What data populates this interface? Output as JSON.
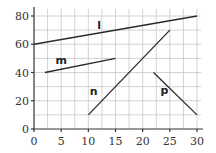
{
  "chart_data": {
    "type": "line",
    "title": "",
    "xlabel": "",
    "ylabel": "",
    "xlim": [
      0,
      30
    ],
    "ylim": [
      0,
      85
    ],
    "grid": true,
    "x_minor_grid_step": 2.5,
    "y_minor_grid_step": 10,
    "x_ticks": [
      0,
      5,
      10,
      15,
      20,
      25,
      30
    ],
    "y_ticks": [
      0,
      20,
      40,
      60,
      80
    ],
    "x_tick_labels": [
      "0",
      "5",
      "10",
      "15",
      "20",
      "25",
      "30"
    ],
    "y_tick_labels": [
      "0",
      "20",
      "40",
      "60",
      "80"
    ],
    "series": [
      {
        "name": "l",
        "points": [
          [
            0,
            60
          ],
          [
            30,
            80
          ]
        ],
        "label_pos": [
          12,
          71
        ]
      },
      {
        "name": "m",
        "points": [
          [
            2,
            40
          ],
          [
            15,
            50
          ]
        ],
        "label_pos": [
          5,
          46
        ]
      },
      {
        "name": "n",
        "points": [
          [
            10,
            10
          ],
          [
            25,
            70
          ]
        ],
        "label_pos": [
          11,
          24
        ]
      },
      {
        "name": "p",
        "points": [
          [
            22,
            40
          ],
          [
            30,
            10
          ]
        ],
        "label_pos": [
          24,
          25
        ]
      }
    ],
    "colors": {
      "line": "#2a2a2a",
      "grid": "#c8c8c8",
      "axis": "#333333"
    }
  }
}
